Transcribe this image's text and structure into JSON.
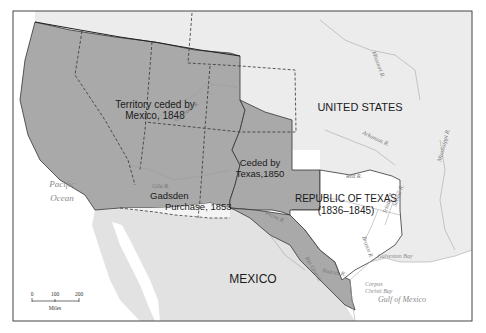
{
  "map": {
    "title": "Territorial expansion: Mexican Cession, Texas, Gadsden Purchase",
    "regions": [
      {
        "id": "mexican-cession",
        "label_line1": "Territory ceded by",
        "label_line2": "Mexico, 1848"
      },
      {
        "id": "texas-cession",
        "label_line1": "Ceded by",
        "label_line2": "Texas,1850"
      },
      {
        "id": "gadsden",
        "label_line1": "Gadsden",
        "label_line2": "Purchase, 1853"
      },
      {
        "id": "republic-texas",
        "label_line1": "REPUBLIC OF TEXAS",
        "label_line2": "(1836–1845)"
      },
      {
        "id": "united-states",
        "label": "UNITED STATES"
      },
      {
        "id": "mexico",
        "label": "MEXICO"
      }
    ],
    "water_labels": {
      "pacific_line1": "Pacific",
      "pacific_line2": "Ocean",
      "gulf": "Gulf of Mexico",
      "galveston": "Galveston Bay",
      "corpus_line1": "Corpus",
      "corpus_line2": "Christi Bay"
    },
    "rivers": {
      "colorado": "Colorado R.",
      "gila": "Gila R.",
      "red": "Red R.",
      "missouri": "Missouri R.",
      "arkansas": "Arkansas R.",
      "mississippi": "Mississippi R.",
      "pecos": "Pecos R.",
      "rio_grande": "Rio Grande",
      "nueces": "Nueces R.",
      "sabine": "Sabine R.",
      "trinity": "Trinity R.",
      "brazos": "Brazos R."
    },
    "scale": {
      "ticks": [
        "0",
        "100",
        "200"
      ],
      "unit": "Miles"
    },
    "colors": {
      "ceded": "#a9a9a9",
      "us_land": "#ececec",
      "mexico_land": "#e2e2e2",
      "texas": "#ffffff",
      "water": "#ffffff",
      "border": "#333333"
    }
  }
}
